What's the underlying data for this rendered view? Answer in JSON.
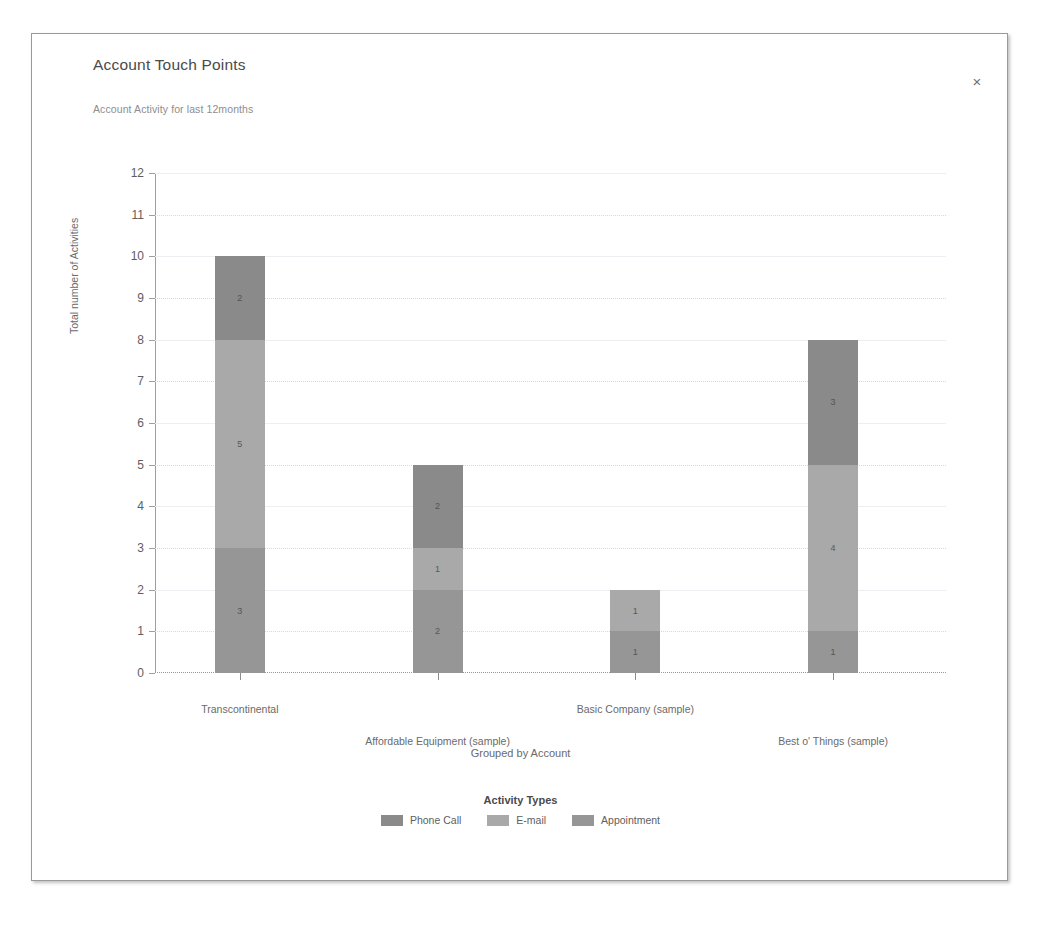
{
  "dialog": {
    "title": "Account Touch Points",
    "close_label": "×"
  },
  "chart_data": {
    "type": "bar",
    "subtype": "stacked-column",
    "title": "Account Touch Points",
    "subtitle": "Account Activity for last 12months",
    "xlabel": "Grouped by Account",
    "ylabel": "Total number of Activities",
    "ylim": [
      0,
      12
    ],
    "yticks": [
      0,
      1,
      2,
      3,
      4,
      5,
      6,
      7,
      8,
      9,
      10,
      11,
      12
    ],
    "grid": true,
    "legend_title": "Activity Types",
    "legend_position": "bottom",
    "categories": [
      "Transcontinental",
      "Affordable  Equipment (sample)",
      "Basic  Company (sample)",
      "Best o' Things (sample)"
    ],
    "series": [
      {
        "name": "Appointment",
        "color": "#969696",
        "values": [
          3,
          2,
          1,
          1
        ]
      },
      {
        "name": "E-mail",
        "color": "#a9a9a9",
        "values": [
          5,
          1,
          1,
          4
        ]
      },
      {
        "name": "Phone Call",
        "color": "#8a8a8a",
        "values": [
          2,
          2,
          0,
          3
        ]
      }
    ],
    "totals": [
      10,
      5,
      2,
      8
    ],
    "legend_order": [
      {
        "name": "Phone Call",
        "color": "#8a8a8a"
      },
      {
        "name": "E-mail",
        "color": "#a9a9a9"
      },
      {
        "name": "Appointment",
        "color": "#969696"
      }
    ]
  }
}
